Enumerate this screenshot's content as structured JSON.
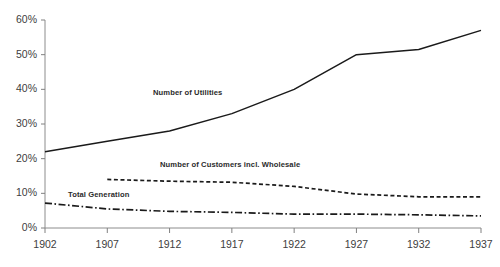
{
  "chart_data": {
    "type": "line",
    "title": "",
    "subtitle": "",
    "xlabel": "",
    "ylabel": "",
    "x": [
      1902,
      1907,
      1912,
      1917,
      1922,
      1927,
      1932,
      1937
    ],
    "xtick_labels": [
      "1902",
      "1907",
      "1912",
      "1917",
      "1922",
      "1927",
      "1932",
      "1937"
    ],
    "ytick_labels": [
      "0%",
      "10%",
      "20%",
      "30%",
      "40%",
      "50%",
      "60%"
    ],
    "ytick_values": [
      0,
      10,
      20,
      30,
      40,
      50,
      60
    ],
    "xlim": [
      1902,
      1937
    ],
    "ylim": [
      0,
      60
    ],
    "grid": false,
    "legend_position": "inline-annotations",
    "series": [
      {
        "name": "Number of Utilities",
        "style": "solid",
        "color": "#1a1a1a",
        "x": [
          1902,
          1907,
          1912,
          1917,
          1922,
          1927,
          1932,
          1937
        ],
        "values": [
          22,
          25,
          28,
          33,
          40,
          50,
          51.5,
          57
        ]
      },
      {
        "name": "Number of Customers incl. Wholesale",
        "style": "dashed",
        "color": "#1a1a1a",
        "x": [
          1907,
          1912,
          1917,
          1922,
          1927,
          1932,
          1937
        ],
        "values": [
          14,
          13.5,
          13.2,
          12,
          9.8,
          9,
          9
        ]
      },
      {
        "name": "Total Generation",
        "style": "dash-dot",
        "color": "#1a1a1a",
        "x": [
          1902,
          1907,
          1912,
          1917,
          1922,
          1927,
          1932,
          1937
        ],
        "values": [
          7.2,
          5.5,
          4.8,
          4.5,
          4,
          4,
          3.8,
          3.5
        ]
      }
    ],
    "annotations": [
      {
        "text": "Number of Utilities",
        "x_px": 153,
        "y_px": 88
      },
      {
        "text": "Number of Customers incl. Wholesale",
        "x_px": 160,
        "y_px": 160
      },
      {
        "text": "Total Generation",
        "x_px": 68,
        "y_px": 190
      }
    ],
    "axis_color": "#808080",
    "text_color": "#404040"
  }
}
